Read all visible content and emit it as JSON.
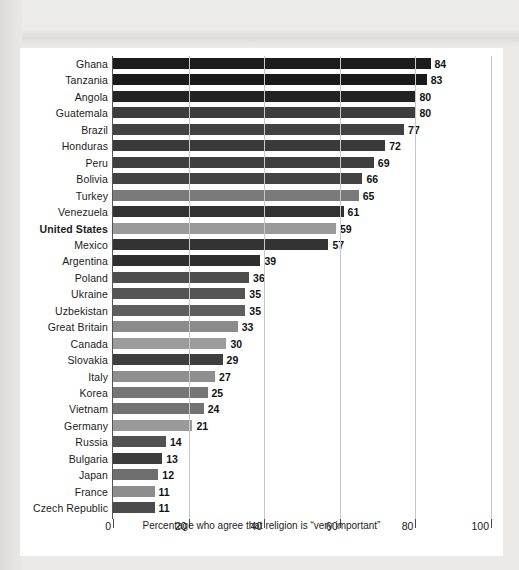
{
  "chart_data": {
    "type": "bar",
    "orientation": "horizontal",
    "title": "",
    "xlabel": "Percentage who agree that religion is “very important”",
    "ylabel": "",
    "xlim": [
      0,
      100
    ],
    "xticks": [
      0,
      20,
      40,
      60,
      80,
      100
    ],
    "grid": "vertical",
    "legend": "none",
    "highlight_category": "United States",
    "categories": [
      "Ghana",
      "Tanzania",
      "Angola",
      "Guatemala",
      "Brazil",
      "Honduras",
      "Peru",
      "Bolivia",
      "Turkey",
      "Venezuela",
      "United States",
      "Mexico",
      "Argentina",
      "Poland",
      "Ukraine",
      "Uzbekistan",
      "Great Britain",
      "Canada",
      "Slovakia",
      "Italy",
      "Korea",
      "Vietnam",
      "Germany",
      "Russia",
      "Bulgaria",
      "Japan",
      "France",
      "Czech Republic"
    ],
    "values": [
      84,
      83,
      80,
      80,
      77,
      72,
      69,
      66,
      65,
      61,
      59,
      57,
      39,
      36,
      35,
      35,
      33,
      30,
      29,
      27,
      25,
      24,
      21,
      14,
      13,
      12,
      11,
      11
    ],
    "bar_colors": [
      "#1c1c1c",
      "#1a1a1a",
      "#232323",
      "#3d3d3d",
      "#424242",
      "#3a3a3a",
      "#3f3f3f",
      "#434343",
      "#7a7a7a",
      "#323232",
      "#9a9a9a",
      "#333333",
      "#2e2e2e",
      "#4d4d4d",
      "#545454",
      "#5e5e5e",
      "#8b8b8b",
      "#9c9c9c",
      "#3e3e3e",
      "#8f8f8f",
      "#767676",
      "#727272",
      "#9a9a9a",
      "#525252",
      "#3c3c3c",
      "#6e6e6e",
      "#8d8d8d",
      "#4b4b4b"
    ]
  },
  "axis": {
    "tick_labels": [
      "0",
      "20",
      "40",
      "60",
      "80",
      "100"
    ],
    "caption": "Percentage who agree that religion is “very important”"
  },
  "colors": {
    "page_background": "#e9e8e6",
    "card_background": "#ffffff",
    "gridline": "#c9c9c9",
    "axis": "#4a4a4a",
    "text": "#1b1b1b"
  }
}
